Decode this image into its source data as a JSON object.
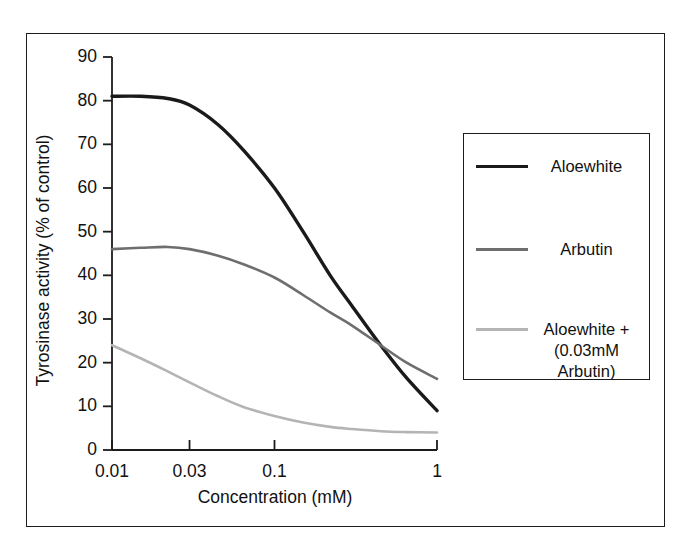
{
  "figure": {
    "background": "#ffffff",
    "frame_color": "#1c1c1c"
  },
  "axes": {
    "y_title": "Tyrosinase activity (% of control)",
    "x_title": "Concentration (mM)",
    "y_ticks": [
      "90",
      "80",
      "70",
      "60",
      "50",
      "40",
      "30",
      "20",
      "10",
      "0"
    ],
    "x_ticks": [
      "0.01",
      "0.03",
      "0.1",
      "1"
    ]
  },
  "legend": {
    "entries": [
      {
        "label": "Aloewhite",
        "color": "#1a1a1a",
        "width": 3.4
      },
      {
        "label": "Arbutin",
        "color": "#6e6e6e",
        "width": 2.6
      },
      {
        "label": "Aloewhite +\n(0.03mM\nArbutin)",
        "color": "#b4b4b4",
        "width": 2.6
      }
    ]
  },
  "chart_data": {
    "type": "line",
    "title": "",
    "xlabel": "Concentration (mM)",
    "ylabel": "Tyrosinase activity (% of control)",
    "xscale": "log",
    "xlim": [
      0.01,
      1
    ],
    "ylim": [
      0,
      90
    ],
    "ytick_step": 10,
    "xticks": [
      0.01,
      0.03,
      0.1,
      1
    ],
    "grid": false,
    "legend_position": "right",
    "series": [
      {
        "name": "Aloewhite",
        "color": "#1a1a1a",
        "x": [
          0.01,
          0.015,
          0.022,
          0.03,
          0.045,
          0.065,
          0.1,
          0.15,
          0.22,
          0.3,
          0.45,
          0.65,
          1.0
        ],
        "values": [
          81,
          81,
          80.5,
          79,
          74.5,
          68.5,
          60,
          50,
          40,
          33,
          24,
          16.5,
          9
        ]
      },
      {
        "name": "Arbutin",
        "color": "#6e6e6e",
        "x": [
          0.01,
          0.015,
          0.022,
          0.03,
          0.045,
          0.065,
          0.1,
          0.15,
          0.22,
          0.3,
          0.45,
          0.65,
          1.0
        ],
        "values": [
          46,
          46.3,
          46.5,
          46,
          44.5,
          42.5,
          39.5,
          35.5,
          31.5,
          28.5,
          24,
          20,
          16.3
        ]
      },
      {
        "name": "Aloewhite + (0.03mM Arbutin)",
        "color": "#b4b4b4",
        "x": [
          0.01,
          0.015,
          0.022,
          0.03,
          0.045,
          0.065,
          0.1,
          0.15,
          0.22,
          0.3,
          0.45,
          0.65,
          1.0
        ],
        "values": [
          24,
          21,
          18,
          15.5,
          12.3,
          9.8,
          7.8,
          6.3,
          5.3,
          4.8,
          4.3,
          4.1,
          4.0
        ]
      }
    ]
  }
}
